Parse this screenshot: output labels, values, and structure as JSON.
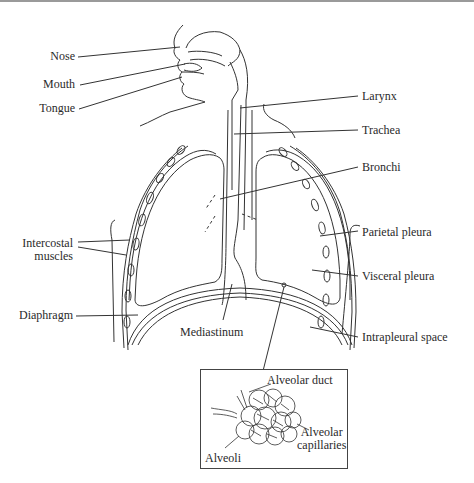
{
  "labels": {
    "nose": "Nose",
    "mouth": "Mouth",
    "tongue": "Tongue",
    "larynx": "Larynx",
    "trachea": "Trachea",
    "bronchi": "Bronchi",
    "intercostal_muscles_1": "Intercostal",
    "intercostal_muscles_2": "muscles",
    "parietal_pleura": "Parietal pleura",
    "visceral_pleura": "Visceral pleura",
    "diaphragm": "Diaphragm",
    "mediastinum": "Mediastinum",
    "intrapleural_space": "Intrapleural space"
  },
  "inset": {
    "alveolar_duct": "Alveolar duct",
    "alveolar_capillaries_1": "Alveolar",
    "alveolar_capillaries_2": "capillaries",
    "alveoli": "Alveoli"
  },
  "colors": {
    "line": "#333333",
    "text": "#2a2a2a",
    "border": "#9a9a9a"
  }
}
